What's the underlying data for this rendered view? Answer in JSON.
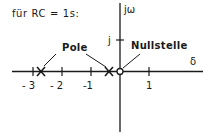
{
  "title": "für RC = 1s:",
  "axes": {
    "real_label": "δ",
    "imag_label": "jω",
    "imag_tick_label": "j",
    "real_ticks": [
      {
        "value": -3,
        "label": "- 3"
      },
      {
        "value": -2,
        "label": "- 2"
      },
      {
        "value": -1,
        "label": "-1"
      },
      {
        "value": 1,
        "label": "1"
      }
    ]
  },
  "annotations": {
    "poles_label": "Pole",
    "zero_label": "Nullstelle"
  },
  "points": {
    "poles": [
      {
        "re": -2.62,
        "im": 0,
        "marker": "x"
      },
      {
        "re": -0.38,
        "im": 0,
        "marker": "x"
      }
    ],
    "zeros": [
      {
        "re": 0,
        "im": 0,
        "marker": "o"
      }
    ]
  },
  "colors": {
    "ink": "#1a1a1a",
    "background": "#ffffff"
  }
}
